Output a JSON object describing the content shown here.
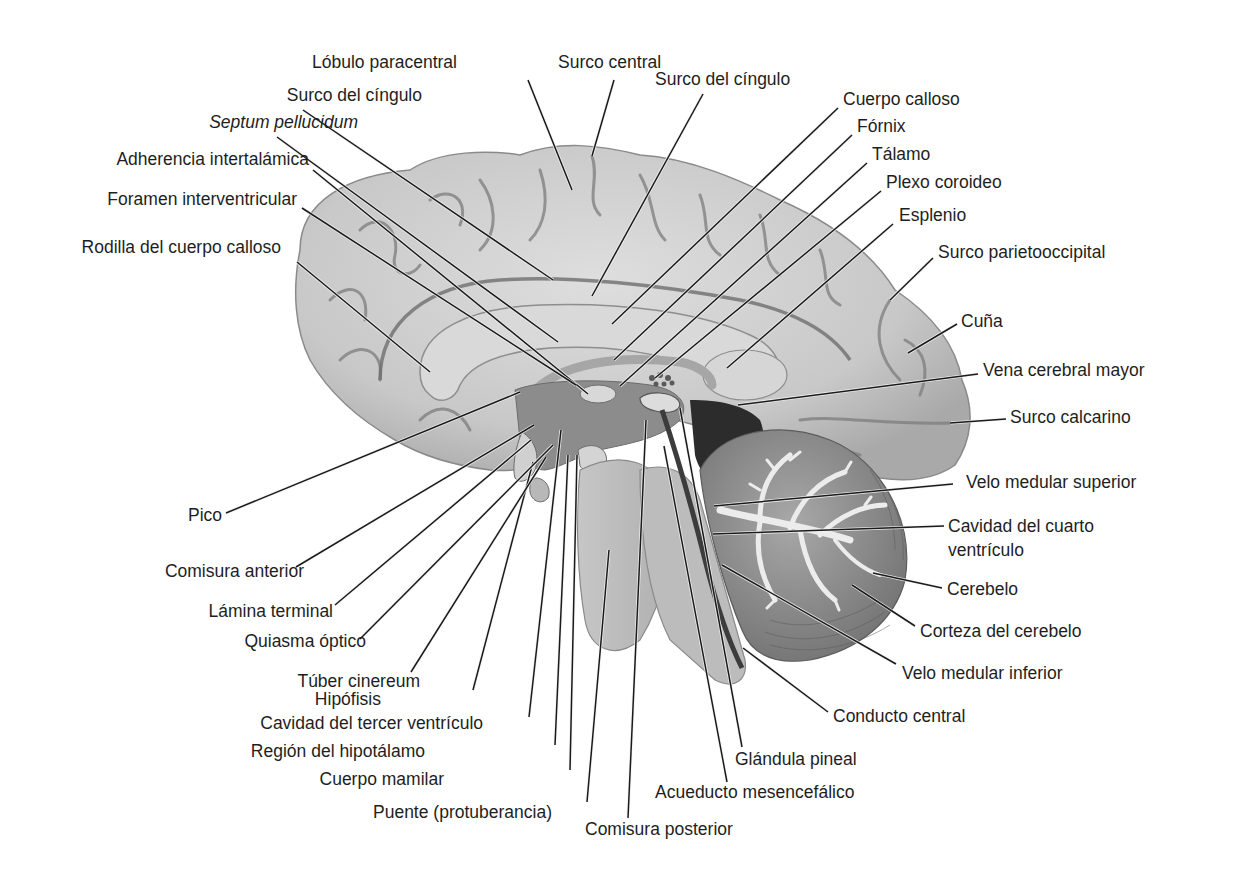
{
  "figure": {
    "colors": {
      "background": "#ffffff",
      "cortex_fill": "#c9c9c9",
      "cortex_light": "#dadada",
      "sulcus": "#7d7d7d",
      "deep": "#8a8a8a",
      "ventricle_dark": "#3a3a3a",
      "cerebellum": "#9a9a9a",
      "arbor_vitae": "#e6e6e6",
      "brainstem": "#bdbdbd",
      "label_text": "#1e1e1e",
      "leader_line": "#1a1a1a"
    }
  },
  "labels": [
    {
      "id": "lobulo-paracentral",
      "text": "Lóbulo paracentral",
      "x": 312,
      "y": 68,
      "anchor": "start",
      "italic": false,
      "line": [
        [
          528,
          80
        ],
        [
          572,
          190
        ]
      ]
    },
    {
      "id": "surco-central-1",
      "text": "Surco central",
      "x": 558,
      "y": 68,
      "anchor": "start",
      "italic": false,
      "line": [
        [
          614,
          80
        ],
        [
          592,
          156
        ]
      ]
    },
    {
      "id": "surco-del-cingulo-right",
      "text": "Surco del cíngulo",
      "x": 655,
      "y": 85,
      "anchor": "start",
      "italic": false,
      "line": [
        [
          703,
          94
        ],
        [
          592,
          296
        ]
      ]
    },
    {
      "id": "surco-del-cingulo-left",
      "text": "Surco del cíngulo",
      "x": 422,
      "y": 101,
      "anchor": "end",
      "italic": false,
      "line": [
        [
          303,
          110
        ],
        [
          553,
          280
        ]
      ]
    },
    {
      "id": "septum-pellucidum",
      "text": "Septum pellucidum",
      "x": 358,
      "y": 128,
      "anchor": "end",
      "italic": true,
      "line": [
        [
          277,
          137
        ],
        [
          558,
          342
        ]
      ]
    },
    {
      "id": "cuerpo-calloso",
      "text": "Cuerpo calloso",
      "x": 843,
      "y": 105,
      "anchor": "start",
      "italic": false,
      "line": [
        [
          838,
          108
        ],
        [
          612,
          324
        ]
      ]
    },
    {
      "id": "fornix",
      "text": "Fórnix",
      "x": 857,
      "y": 132,
      "anchor": "start",
      "italic": false,
      "line": [
        [
          852,
          135
        ],
        [
          614,
          360
        ]
      ]
    },
    {
      "id": "talamo",
      "text": "Tálamo",
      "x": 872,
      "y": 160,
      "anchor": "start",
      "italic": false,
      "line": [
        [
          867,
          163
        ],
        [
          620,
          386
        ]
      ]
    },
    {
      "id": "plexo-coroideo",
      "text": "Plexo coroideo",
      "x": 886,
      "y": 188,
      "anchor": "start",
      "italic": false,
      "line": [
        [
          881,
          191
        ],
        [
          655,
          378
        ]
      ]
    },
    {
      "id": "esplenio",
      "text": "Esplenio",
      "x": 899,
      "y": 221,
      "anchor": "start",
      "italic": false,
      "line": [
        [
          893,
          224
        ],
        [
          727,
          368
        ]
      ]
    },
    {
      "id": "adherencia-intertalamica",
      "text": "Adherencia intertalámica",
      "x": 309,
      "y": 165,
      "anchor": "end",
      "italic": false,
      "line": [
        [
          313,
          170
        ],
        [
          588,
          394
        ]
      ]
    },
    {
      "id": "foramen-interventricular",
      "text": "Foramen interventricular",
      "x": 297,
      "y": 205,
      "anchor": "end",
      "italic": false,
      "line": [
        [
          302,
          208
        ],
        [
          576,
          385
        ]
      ]
    },
    {
      "id": "rodilla-cuerpo-calloso",
      "text": "Rodilla del cuerpo calloso",
      "x": 281,
      "y": 253,
      "anchor": "end",
      "italic": false,
      "line": [
        [
          297,
          262
        ],
        [
          430,
          372
        ]
      ]
    },
    {
      "id": "surco-parietooccipital",
      "text": "Surco parietooccipital",
      "x": 938,
      "y": 258,
      "anchor": "start",
      "italic": false,
      "line": [
        [
          933,
          258
        ],
        [
          890,
          300
        ]
      ]
    },
    {
      "id": "cuna",
      "text": "Cuña",
      "x": 961,
      "y": 327,
      "anchor": "start",
      "italic": false,
      "line": [
        [
          957,
          324
        ],
        [
          908,
          353
        ]
      ]
    },
    {
      "id": "vena-cerebral-mayor",
      "text": "Vena cerebral mayor",
      "x": 983,
      "y": 376,
      "anchor": "start",
      "italic": false,
      "line": [
        [
          978,
          374
        ],
        [
          738,
          405
        ]
      ]
    },
    {
      "id": "surco-calcarino",
      "text": "Surco calcarino",
      "x": 1010,
      "y": 423,
      "anchor": "start",
      "italic": false,
      "line": [
        [
          1006,
          419
        ],
        [
          950,
          423
        ]
      ]
    },
    {
      "id": "velo-medular-superior",
      "text": "Velo medular superior",
      "x": 966,
      "y": 488,
      "anchor": "start",
      "italic": false,
      "line": [
        [
          953,
          484
        ],
        [
          714,
          506
        ]
      ]
    },
    {
      "id": "cavidad-cuarto-ventriculo-1",
      "text": "Cavidad del cuarto",
      "x": 948,
      "y": 532,
      "anchor": "start",
      "italic": false,
      "line": [
        [
          944,
          526
        ],
        [
          713,
          534
        ]
      ]
    },
    {
      "id": "cavidad-cuarto-ventriculo-2",
      "text": "ventrículo",
      "x": 948,
      "y": 556,
      "anchor": "start",
      "italic": false,
      "line": null
    },
    {
      "id": "cerebelo",
      "text": "Cerebelo",
      "x": 947,
      "y": 595,
      "anchor": "start",
      "italic": false,
      "line": [
        [
          942,
          588
        ],
        [
          873,
          573
        ]
      ]
    },
    {
      "id": "corteza-cerebelo",
      "text": "Corteza del cerebelo",
      "x": 920,
      "y": 637,
      "anchor": "start",
      "italic": false,
      "line": [
        [
          915,
          626
        ],
        [
          852,
          585
        ]
      ]
    },
    {
      "id": "velo-medular-inferior",
      "text": "Velo medular inferior",
      "x": 902,
      "y": 679,
      "anchor": "start",
      "italic": false,
      "line": [
        [
          896,
          664
        ],
        [
          722,
          565
        ]
      ]
    },
    {
      "id": "conducto-central",
      "text": "Conducto central",
      "x": 833,
      "y": 722,
      "anchor": "start",
      "italic": false,
      "line": [
        [
          828,
          712
        ],
        [
          743,
          648
        ]
      ]
    },
    {
      "id": "glandula-pineal",
      "text": "Glándula pineal",
      "x": 735,
      "y": 765,
      "anchor": "start",
      "italic": false,
      "line": [
        [
          742,
          747
        ],
        [
          680,
          408
        ]
      ]
    },
    {
      "id": "acueducto-mesencefalico",
      "text": "Acueducto mesencefálico",
      "x": 655,
      "y": 798,
      "anchor": "start",
      "italic": false,
      "line": [
        [
          727,
          782
        ],
        [
          664,
          446
        ]
      ]
    },
    {
      "id": "comisura-posterior",
      "text": "Comisura posterior",
      "x": 585,
      "y": 835,
      "anchor": "start",
      "italic": false,
      "line": [
        [
          628,
          818
        ],
        [
          646,
          420
        ]
      ]
    },
    {
      "id": "puente",
      "text": "Puente (protuberancia)",
      "x": 552,
      "y": 818,
      "anchor": "end",
      "italic": false,
      "line": [
        [
          587,
          802
        ],
        [
          609,
          550
        ]
      ]
    },
    {
      "id": "cuerpo-mamilar",
      "text": "Cuerpo mamilar",
      "x": 444,
      "y": 785,
      "anchor": "end",
      "italic": false,
      "line": [
        [
          570,
          770
        ],
        [
          577,
          455
        ]
      ]
    },
    {
      "id": "region-hipotalamo",
      "text": "Región del hipotálamo",
      "x": 425,
      "y": 757,
      "anchor": "end",
      "italic": false,
      "line": [
        [
          555,
          745
        ],
        [
          568,
          455
        ]
      ]
    },
    {
      "id": "cavidad-tercer-ventriculo",
      "text": "Cavidad del tercer ventrículo",
      "x": 483,
      "y": 729,
      "anchor": "end",
      "italic": false,
      "line": [
        [
          529,
          717
        ],
        [
          561,
          430
        ]
      ]
    },
    {
      "id": "hipofisis",
      "text": "Hipófisis",
      "x": 381,
      "y": 705,
      "anchor": "end",
      "italic": false,
      "line": [
        [
          473,
          690
        ],
        [
          533,
          462
        ]
      ]
    },
    {
      "id": "tuber-cinereum",
      "text": "Túber cinereum",
      "x": 420,
      "y": 687,
      "anchor": "end",
      "italic": false,
      "line": [
        [
          411,
          672
        ],
        [
          546,
          457
        ]
      ]
    },
    {
      "id": "quiasma-optico",
      "text": "Quiasma óptico",
      "x": 366,
      "y": 647,
      "anchor": "end",
      "italic": false,
      "line": [
        [
          360,
          639
        ],
        [
          553,
          445
        ]
      ]
    },
    {
      "id": "lamina-terminal",
      "text": "Lámina terminal",
      "x": 333,
      "y": 617,
      "anchor": "end",
      "italic": false,
      "line": [
        [
          335,
          605
        ],
        [
          531,
          440
        ]
      ]
    },
    {
      "id": "comisura-anterior",
      "text": "Comisura anterior",
      "x": 304,
      "y": 577,
      "anchor": "end",
      "italic": false,
      "line": [
        [
          296,
          567
        ],
        [
          534,
          425
        ]
      ]
    },
    {
      "id": "pico",
      "text": "Pico",
      "x": 222,
      "y": 521,
      "anchor": "end",
      "italic": false,
      "line": [
        [
          226,
          513
        ],
        [
          520,
          392
        ]
      ]
    }
  ]
}
